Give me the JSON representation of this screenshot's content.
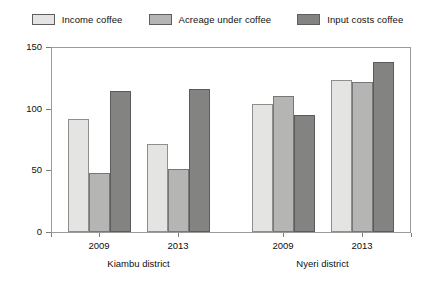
{
  "legend": {
    "items": [
      {
        "label": "Income coffee",
        "color": "#e4e4e2",
        "key": "income-coffee"
      },
      {
        "label": "Acreage under coffee",
        "color": "#b5b5b3",
        "key": "acreage-under-coffee"
      },
      {
        "label": "Input costs coffee",
        "color": "#838382",
        "key": "input-costs-coffee"
      }
    ]
  },
  "axes": {
    "y_ticks": [
      "0",
      "50",
      "100",
      "150"
    ],
    "x_tick_labels": [
      "2009",
      "2013",
      "2009",
      "2013"
    ],
    "group_labels": [
      "Kiambu district",
      "Nyeri district"
    ]
  },
  "chart_data": {
    "type": "bar",
    "title": "",
    "xlabel": "",
    "ylabel": "",
    "ylim": [
      0,
      150
    ],
    "yticks": [
      0,
      50,
      100,
      150
    ],
    "grid": false,
    "legend_position": "top-center",
    "categories": [
      "2009",
      "2013",
      "2009",
      "2013"
    ],
    "category_groups": [
      {
        "name": "Kiambu district",
        "categories": [
          "2009",
          "2013"
        ]
      },
      {
        "name": "Nyeri district",
        "categories": [
          "2009",
          "2013"
        ]
      }
    ],
    "series": [
      {
        "name": "Income coffee",
        "color": "#e4e4e2",
        "values": [
          92,
          71,
          104,
          123
        ]
      },
      {
        "name": "Acreage under coffee",
        "color": "#b5b5b3",
        "values": [
          48,
          51,
          110,
          122
        ]
      },
      {
        "name": "Input costs coffee",
        "color": "#838382",
        "values": [
          114,
          116,
          95,
          138
        ]
      }
    ]
  }
}
